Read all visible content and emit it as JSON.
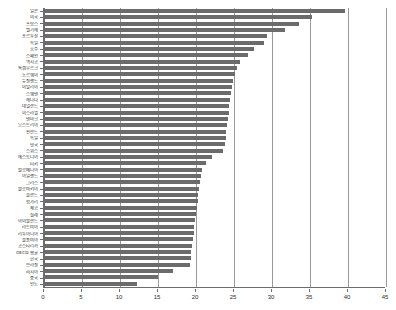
{
  "chart_data": {
    "type": "bar",
    "orientation": "horizontal",
    "title": "",
    "subtitle": "",
    "xlabel": "",
    "ylabel": "",
    "xlim": [
      0,
      45
    ],
    "xticks": [
      0,
      5,
      10,
      15,
      20,
      25,
      30,
      35,
      40,
      45
    ],
    "grid": true,
    "legend": false,
    "legend_position": "none",
    "bar_color": "#6b6b6b",
    "gridline_color": "#9a9a9a",
    "axis_color": "#6d6d6d",
    "categories": [
      "일본",
      "미국",
      "프랑스",
      "벨기에",
      "포르투갈",
      "독일",
      "호주",
      "스페인",
      "멕시코",
      "룩셈부르크",
      "노르웨이",
      "뉴질랜드",
      "이탈리아",
      "스웨덴",
      "캐나다",
      "네덜란드",
      "이스라엘",
      "덴마크",
      "오스트리아",
      "핀란드",
      "독일",
      "영국",
      "스위스",
      "에스토니아",
      "터키",
      "슬로베니아",
      "아일랜드",
      "그리스",
      "슬로바키아",
      "폴란드",
      "헝가리",
      "체코",
      "칠레",
      "아이슬란드",
      "라트비아",
      "리투아니아",
      "콜롬비아",
      "코스타리카",
      "OECD 평균",
      "한국",
      "브라질",
      "러시아",
      "중국",
      "인도"
    ],
    "values": [
      39.6,
      35.2,
      33.6,
      31.7,
      29.4,
      28.9,
      27.6,
      26.9,
      25.8,
      25.4,
      25.1,
      24.9,
      24.7,
      24.6,
      24.5,
      24.4,
      24.3,
      24.2,
      24.1,
      24.0,
      23.9,
      23.8,
      23.6,
      22.1,
      21.3,
      20.8,
      20.6,
      20.5,
      20.4,
      20.3,
      20.2,
      20.1,
      20.0,
      19.9,
      19.8,
      19.7,
      19.6,
      19.5,
      19.4,
      19.3,
      19.2,
      17.0,
      15.0,
      12.3
    ]
  }
}
